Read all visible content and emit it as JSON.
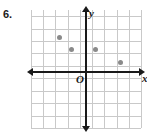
{
  "problem": {
    "label": "6."
  },
  "chart_data": {
    "type": "scatter",
    "title": "",
    "xlabel": "x",
    "ylabel": "y",
    "origin_label": "O",
    "grid": true,
    "grid_step": 1,
    "xlim": [
      -4.5,
      4.5
    ],
    "ylim": [
      -4.5,
      5.0
    ],
    "point_color": "#8a8a8a",
    "axis_color": "#1a1a1a",
    "grid_color": "#c9c9c9",
    "points": [
      {
        "x": -2.2,
        "y": 2.8
      },
      {
        "x": -1.2,
        "y": 1.8
      },
      {
        "x": 0.8,
        "y": 1.8
      },
      {
        "x": 2.8,
        "y": 0.8
      }
    ],
    "x_gridlines": [
      -4.5,
      -3.5,
      -2.5,
      -1.5,
      -0.5,
      0.5,
      1.5,
      2.5,
      3.5,
      4.5
    ],
    "y_gridlines": [
      -4.5,
      -3.5,
      -2.5,
      -1.5,
      -0.5,
      0.5,
      1.5,
      2.5,
      3.5,
      4.5
    ]
  }
}
